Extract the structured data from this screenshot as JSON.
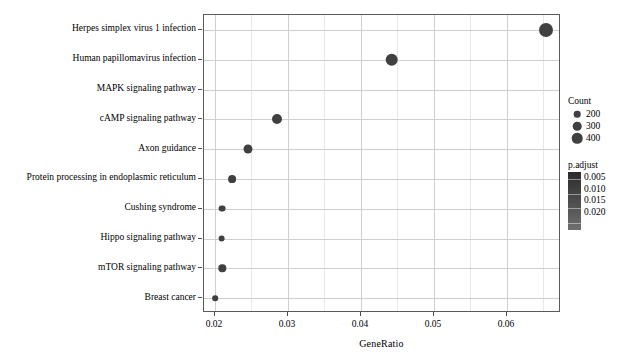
{
  "chart_data": {
    "type": "scatter",
    "title": "",
    "xlabel": "GeneRatio",
    "ylabel": "",
    "xlim": [
      0.0185,
      0.0674
    ],
    "xticks": [
      0.02,
      0.03,
      0.04,
      0.05,
      0.06
    ],
    "xtick_labels": [
      "0.02",
      "0.03",
      "0.04",
      "0.05",
      "0.06"
    ],
    "grid": true,
    "legend_position": "right",
    "categories": [
      "Herpes simplex virus 1 infection",
      "Human papillomavirus infection",
      "MAPK signaling pathway",
      "cAMP signaling pathway",
      "Axon guidance",
      "Protein processing in endoplasmic reticulum",
      "Cushing syndrome",
      "Hippo signaling pathway",
      "mTOR signaling pathway",
      "Breast cancer"
    ],
    "points": [
      {
        "label": "Herpes simplex virus 1 infection",
        "gene_ratio": 0.0653,
        "count": 430,
        "p_adjust": 0.004,
        "radius_px": 7.0
      },
      {
        "label": "Human papillomavirus infection",
        "gene_ratio": 0.0442,
        "count": 390,
        "p_adjust": 0.006,
        "radius_px": 6.3
      },
      {
        "label": "MAPK signaling pathway",
        "gene_ratio": null,
        "count": null,
        "p_adjust": null,
        "radius_px": 0
      },
      {
        "label": "cAMP signaling pathway",
        "gene_ratio": 0.0285,
        "count": 300,
        "p_adjust": 0.01,
        "radius_px": 5.0
      },
      {
        "label": "Axon guidance",
        "gene_ratio": 0.0245,
        "count": 270,
        "p_adjust": 0.012,
        "radius_px": 4.5
      },
      {
        "label": "Protein processing in endoplasmic reticulum",
        "gene_ratio": 0.0224,
        "count": 250,
        "p_adjust": 0.014,
        "radius_px": 3.9
      },
      {
        "label": "Cushing syndrome",
        "gene_ratio": 0.021,
        "count": 230,
        "p_adjust": 0.017,
        "radius_px": 3.4
      },
      {
        "label": "Hippo signaling pathway",
        "gene_ratio": 0.0209,
        "count": 228,
        "p_adjust": 0.017,
        "radius_px": 3.4
      },
      {
        "label": "mTOR signaling pathway",
        "gene_ratio": 0.021,
        "count": 235,
        "p_adjust": 0.016,
        "radius_px": 3.7
      },
      {
        "label": "Breast cancer",
        "gene_ratio": 0.02,
        "count": 205,
        "p_adjust": 0.02,
        "radius_px": 2.8
      }
    ],
    "size_legend": {
      "title": "Count",
      "entries": [
        {
          "label": "200",
          "value": 200,
          "radius_px": 3.3
        },
        {
          "label": "300",
          "value": 300,
          "radius_px": 4.3
        },
        {
          "label": "400",
          "value": 400,
          "radius_px": 5.3
        }
      ]
    },
    "color_legend": {
      "title": "p.adjust",
      "labels": [
        "0.005",
        "0.010",
        "0.015",
        "0.020"
      ],
      "values": [
        0.005,
        0.01,
        0.015,
        0.02
      ],
      "low_color": "#2b2b2b",
      "high_color": "#6f6f6f"
    },
    "style": {
      "point_color": "#404040",
      "panel_border": "#595959",
      "gridline_major": "#cfcfcf",
      "gridline_minor": "#e8e8e8",
      "background": "#ffffff",
      "text_color": "#000000"
    }
  }
}
